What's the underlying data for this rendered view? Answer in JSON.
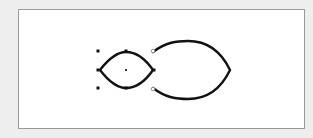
{
  "canvas": {
    "background": "#ffffff",
    "border_color": "#9a9a9a",
    "page_background": "#eeeeee"
  },
  "shapes": [
    {
      "id": "small-lens",
      "type": "lens",
      "selected": true,
      "stroke": "#111111",
      "left_tip": [
        100,
        70
      ],
      "right_tip": [
        153,
        70
      ],
      "top": [
        126,
        52
      ],
      "bottom": [
        126,
        88
      ]
    },
    {
      "id": "large-lens",
      "type": "lens",
      "selected": false,
      "stroke": "#111111",
      "top_left_end": [
        153,
        52
      ],
      "bottom_left_end": [
        153,
        88
      ],
      "right_tip": [
        230,
        70
      ],
      "top": [
        188,
        41
      ],
      "bottom": [
        188,
        99
      ]
    }
  ],
  "selection": {
    "handles": [
      [
        98,
        51
      ],
      [
        126,
        51
      ],
      [
        98,
        70
      ],
      [
        154,
        70
      ],
      [
        98,
        88
      ],
      [
        126,
        88
      ]
    ],
    "center": [
      126,
      70
    ],
    "connection_points": [
      [
        153,
        51
      ],
      [
        153,
        89
      ]
    ]
  }
}
